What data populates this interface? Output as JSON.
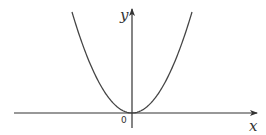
{
  "diagram": {
    "type": "function-graph",
    "function": "y = a*x^2 (a > 0), parabola opening upward with vertex at origin",
    "labels": {
      "x_axis": "x",
      "y_axis": "y",
      "origin": "0"
    },
    "colors": {
      "axis": "#333333",
      "curve": "#444444",
      "background": "#ffffff"
    }
  }
}
